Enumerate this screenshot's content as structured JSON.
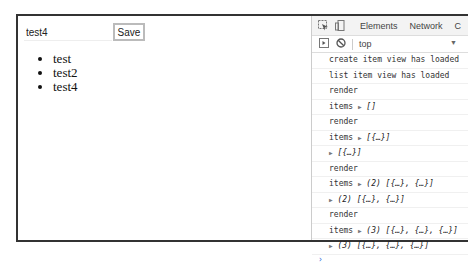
{
  "page": {
    "input_value": "test4",
    "save_label": "Save",
    "items": [
      "test",
      "test2",
      "test4"
    ]
  },
  "devtools": {
    "tabs": [
      "Elements",
      "Network",
      "C"
    ],
    "context": "top",
    "icons": {
      "inspect": "inspect-element-icon",
      "device": "device-toolbar-icon",
      "sidebar": "console-sidebar-icon",
      "clear": "clear-console-icon"
    },
    "console_lines": [
      {
        "text": "create item view has loaded"
      },
      {
        "text": "list item view has loaded"
      },
      {
        "text": "render"
      },
      {
        "prefix": "items ",
        "tri": "▶",
        "obj": " []"
      },
      {
        "text": "render"
      },
      {
        "prefix": "items ",
        "tri": "▶",
        "obj": " [{…}]"
      },
      {
        "prefix": "",
        "tri": "▶",
        "obj": " [{…}]"
      },
      {
        "text": "render"
      },
      {
        "prefix": "items ",
        "tri": "▶",
        "obj": " (2) [{…}, {…}]"
      },
      {
        "prefix": "",
        "tri": "▶",
        "obj": " (2) [{…}, {…}]"
      },
      {
        "text": "render"
      },
      {
        "prefix": "items ",
        "tri": "▶",
        "obj": " (3) [{…}, {…}, {…}]"
      },
      {
        "prefix": "",
        "tri": "▶",
        "obj": " (3) [{…}, {…}, {…}]"
      }
    ],
    "prompt": "›"
  }
}
